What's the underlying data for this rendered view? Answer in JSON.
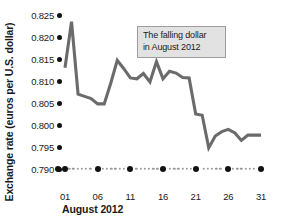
{
  "chart_data": {
    "type": "line",
    "title": "",
    "xlabel": "August 2012",
    "ylabel": "Exchange rate (euros per U.S. dollar)",
    "ylim": [
      0.79,
      0.8255
    ],
    "xlim": [
      1,
      31
    ],
    "grid": false,
    "legend": "none",
    "line_color": "#6b6b6b",
    "y_ticks": [
      "0.825",
      "0.820",
      "0.815",
      "0.810",
      "0.805",
      "0.800",
      "0.795",
      "0.790"
    ],
    "y_tick_values": [
      0.825,
      0.82,
      0.815,
      0.81,
      0.805,
      0.8,
      0.795,
      0.79
    ],
    "x_ticks": [
      "01",
      "06",
      "11",
      "16",
      "21",
      "26",
      "31"
    ],
    "x_tick_values": [
      1,
      6,
      11,
      16,
      21,
      26,
      31
    ],
    "x": [
      1,
      2,
      3,
      4,
      5,
      6,
      7,
      8,
      9,
      10,
      11,
      12,
      13,
      14,
      15,
      16,
      17,
      18,
      19,
      20,
      21,
      22,
      23,
      24,
      25,
      26,
      27,
      28,
      29,
      30,
      31
    ],
    "values": [
      0.813,
      0.8235,
      0.807,
      0.8065,
      0.806,
      0.8048,
      0.8048,
      0.8095,
      0.8147,
      0.8128,
      0.8107,
      0.8105,
      0.8117,
      0.8098,
      0.8144,
      0.8105,
      0.8122,
      0.8118,
      0.8108,
      0.8107,
      0.8025,
      0.8022,
      0.7948,
      0.7975,
      0.7985,
      0.799,
      0.7982,
      0.7965,
      0.7977,
      0.7977,
      0.7977
    ],
    "annotation": {
      "line1": "The falling dollar",
      "line2": "in August 2012"
    }
  }
}
